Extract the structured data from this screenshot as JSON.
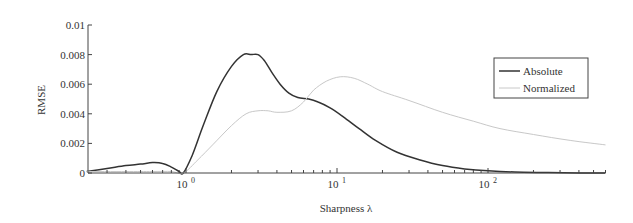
{
  "chart_data": {
    "type": "line",
    "title": "",
    "xlabel": "Sharpness λ",
    "ylabel": "RMSE",
    "xscale": "log",
    "xlim": [
      0.22,
      600
    ],
    "ylim": [
      0,
      0.01
    ],
    "grid": false,
    "legend_position": "upper right",
    "x_tick_labels": [
      {
        "base": "10",
        "exp": "0",
        "value": 1
      },
      {
        "base": "10",
        "exp": "1",
        "value": 10
      },
      {
        "base": "10",
        "exp": "2",
        "value": 100
      }
    ],
    "y_tick_labels": [
      "0",
      "0.002",
      "0.004",
      "0.006",
      "0.008",
      "0.01"
    ],
    "y_ticks": [
      0,
      0.002,
      0.004,
      0.006,
      0.008,
      0.01
    ],
    "series": [
      {
        "name": "Absolute",
        "color": "#333333",
        "width": 1.5,
        "x": [
          0.22,
          0.3,
          0.4,
          0.5,
          0.6,
          0.7,
          0.8,
          0.9,
          0.96,
          1.1,
          1.3,
          1.6,
          2.0,
          2.4,
          2.7,
          3.0,
          3.3,
          3.7,
          4.2,
          4.8,
          5.5,
          6.5,
          7.5,
          9.0,
          11,
          14,
          18,
          25,
          35,
          50,
          70,
          100,
          150,
          250,
          400,
          600
        ],
        "values": [
          0.0001,
          0.0003,
          0.0005,
          0.0006,
          0.0007,
          0.00065,
          0.0004,
          0.0001,
          0.0,
          0.0012,
          0.0032,
          0.0055,
          0.0072,
          0.008,
          0.008,
          0.008,
          0.0076,
          0.0068,
          0.006,
          0.0054,
          0.0051,
          0.005,
          0.0048,
          0.0044,
          0.0038,
          0.003,
          0.0022,
          0.0014,
          0.0009,
          0.0005,
          0.00028,
          0.00015,
          7e-05,
          3e-05,
          1e-05,
          0.0
        ]
      },
      {
        "name": "Normalized",
        "color": "#c8c8c8",
        "width": 1.0,
        "x": [
          0.22,
          0.4,
          0.6,
          0.8,
          0.96,
          1.2,
          1.5,
          2.0,
          2.5,
          3.0,
          3.5,
          4.0,
          5.0,
          6.0,
          7.0,
          8.5,
          10.5,
          13,
          16,
          20,
          30,
          50,
          80,
          120,
          200,
          350,
          600
        ],
        "values": [
          0.0001,
          0.0001,
          0.0001,
          0.0001,
          0.0,
          0.0009,
          0.0019,
          0.0032,
          0.004,
          0.0042,
          0.0042,
          0.0041,
          0.0042,
          0.0048,
          0.0056,
          0.0062,
          0.0065,
          0.0064,
          0.006,
          0.0055,
          0.0049,
          0.0041,
          0.0035,
          0.003,
          0.0026,
          0.0022,
          0.0019
        ]
      }
    ]
  },
  "legend": {
    "items": [
      {
        "label": "Absolute",
        "color": "#333333"
      },
      {
        "label": "Normalized",
        "color": "#c8c8c8"
      }
    ]
  }
}
